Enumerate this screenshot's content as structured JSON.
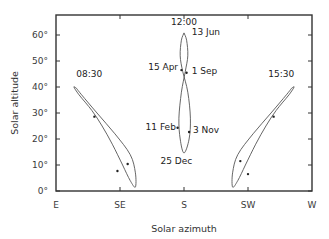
{
  "chart_data": {
    "type": "line",
    "title": "",
    "xlabel": "Solar azimuth",
    "ylabel": "Solar altitude",
    "x_ticks": [
      "E",
      "SE",
      "S",
      "SW",
      "W"
    ],
    "y_ticks": [
      "0°",
      "10°",
      "20°",
      "30°",
      "40°",
      "50°",
      "60°"
    ],
    "ylim": [
      0,
      68
    ],
    "grid": false,
    "series": [
      {
        "name": "08:30",
        "description": "analemma at 08:30",
        "points": [
          [
            0.08,
            39.5
          ],
          [
            0.1,
            37
          ],
          [
            0.16,
            30
          ],
          [
            0.23,
            22
          ],
          [
            0.29,
            14
          ],
          [
            0.31,
            7
          ],
          [
            0.31,
            1.5
          ],
          [
            0.29,
            4
          ],
          [
            0.26,
            10
          ],
          [
            0.22,
            18
          ],
          [
            0.18,
            25
          ],
          [
            0.14,
            31
          ],
          [
            0.09,
            37
          ],
          [
            0.07,
            40
          ],
          [
            0.08,
            39.5
          ]
        ],
        "marked": [
          [
            0.15,
            28.6
          ],
          [
            0.28,
            10.4
          ],
          [
            0.24,
            7.7
          ]
        ]
      },
      {
        "name": "12:00",
        "description": "analemma at noon",
        "points": [
          [
            0.5,
            60.8
          ],
          [
            0.51,
            58
          ],
          [
            0.515,
            52
          ],
          [
            0.505,
            46
          ],
          [
            0.49,
            38
          ],
          [
            0.48,
            28
          ],
          [
            0.485,
            20
          ],
          [
            0.5,
            14.6
          ],
          [
            0.52,
            20
          ],
          [
            0.525,
            28
          ],
          [
            0.515,
            38
          ],
          [
            0.495,
            46
          ],
          [
            0.485,
            52
          ],
          [
            0.49,
            58
          ],
          [
            0.5,
            60.8
          ]
        ],
        "marked": [
          [
            0.49,
            46.5
          ],
          [
            0.51,
            45.5
          ],
          [
            0.475,
            24.3
          ],
          [
            0.52,
            22.7
          ]
        ]
      },
      {
        "name": "15:30",
        "description": "analemma at 15:30",
        "points": [
          [
            0.92,
            39.5
          ],
          [
            0.9,
            37
          ],
          [
            0.84,
            30
          ],
          [
            0.77,
            22
          ],
          [
            0.71,
            14
          ],
          [
            0.69,
            7
          ],
          [
            0.69,
            1.5
          ],
          [
            0.71,
            4
          ],
          [
            0.74,
            10
          ],
          [
            0.78,
            18
          ],
          [
            0.82,
            25
          ],
          [
            0.86,
            31
          ],
          [
            0.91,
            37
          ],
          [
            0.93,
            40
          ],
          [
            0.92,
            39.5
          ]
        ],
        "marked": [
          [
            0.85,
            28.6
          ],
          [
            0.72,
            11.5
          ],
          [
            0.75,
            6.5
          ]
        ]
      }
    ],
    "annotations": [
      {
        "text": "08:30",
        "x": 0.13,
        "y": 44
      },
      {
        "text": "12:00",
        "x": 0.5,
        "y": 64
      },
      {
        "text": "13 Jun",
        "x": 0.53,
        "y": 60
      },
      {
        "text": "15 Apr",
        "x": 0.36,
        "y": 46.5
      },
      {
        "text": "1 Sep",
        "x": 0.53,
        "y": 45
      },
      {
        "text": "11 Feb",
        "x": 0.35,
        "y": 23.5
      },
      {
        "text": "3 Nov",
        "x": 0.535,
        "y": 22.5
      },
      {
        "text": "25 Dec",
        "x": 0.47,
        "y": 10.5
      },
      {
        "text": "15:30",
        "x": 0.88,
        "y": 44
      }
    ]
  }
}
